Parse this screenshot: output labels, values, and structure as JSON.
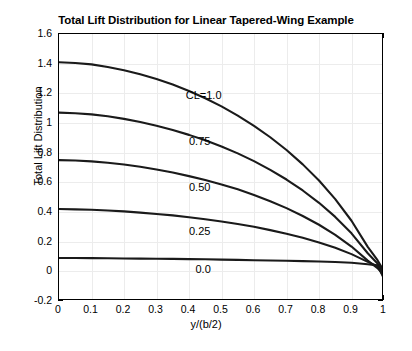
{
  "chart_data": {
    "type": "line",
    "title": "Total Lift Distribution for Linear Tapered-Wing Example",
    "xlabel": "y/(b/2)",
    "ylabel": "Total Lift Distribution",
    "xlim": [
      0,
      1
    ],
    "ylim": [
      -0.2,
      1.6
    ],
    "xticks": [
      "0",
      "0.1",
      "0.2",
      "0.3",
      "0.4",
      "0.5",
      "0.6",
      "0.7",
      "0.8",
      "0.9",
      "1"
    ],
    "yticks": [
      "1.6",
      "1.4",
      "1.2",
      "1",
      "0.8",
      "0.6",
      "0.4",
      "0.2",
      "0",
      "-0.2"
    ],
    "grid": true,
    "legend": "inline-annotations",
    "x": [
      0,
      0.05,
      0.1,
      0.15,
      0.2,
      0.25,
      0.3,
      0.35,
      0.4,
      0.45,
      0.5,
      0.55,
      0.6,
      0.65,
      0.7,
      0.75,
      0.8,
      0.85,
      0.9,
      0.95,
      0.98,
      1
    ],
    "series": [
      {
        "name": "CL=1.0",
        "label": "CL=1.0",
        "values": [
          1.41,
          1.405,
          1.395,
          1.378,
          1.356,
          1.329,
          1.297,
          1.259,
          1.216,
          1.167,
          1.112,
          1.05,
          0.981,
          0.904,
          0.818,
          0.721,
          0.612,
          0.487,
          0.341,
          0.165,
          0.075,
          0.0
        ]
      },
      {
        "name": "CL=0.75",
        "label": "0.75",
        "values": [
          1.07,
          1.066,
          1.058,
          1.045,
          1.028,
          1.007,
          0.982,
          0.953,
          0.92,
          0.883,
          0.842,
          0.795,
          0.743,
          0.684,
          0.619,
          0.545,
          0.462,
          0.367,
          0.256,
          0.122,
          0.053,
          -0.013
        ]
      },
      {
        "name": "CL=0.50",
        "label": "0.50",
        "values": [
          0.75,
          0.747,
          0.741,
          0.732,
          0.72,
          0.705,
          0.687,
          0.666,
          0.642,
          0.616,
          0.586,
          0.553,
          0.515,
          0.473,
          0.426,
          0.373,
          0.314,
          0.246,
          0.167,
          0.072,
          0.022,
          -0.026
        ]
      },
      {
        "name": "CL=0.25",
        "label": "0.25",
        "values": [
          0.42,
          0.418,
          0.415,
          0.41,
          0.404,
          0.396,
          0.387,
          0.377,
          0.365,
          0.351,
          0.336,
          0.319,
          0.3,
          0.278,
          0.254,
          0.226,
          0.195,
          0.159,
          0.116,
          0.064,
          0.035,
          -0.038
        ]
      },
      {
        "name": "CL=0.0",
        "label": "0.0",
        "values": [
          0.09,
          0.09,
          0.089,
          0.088,
          0.087,
          0.086,
          0.085,
          0.084,
          0.082,
          0.081,
          0.079,
          0.077,
          0.075,
          0.073,
          0.071,
          0.069,
          0.066,
          0.063,
          0.058,
          0.048,
          0.04,
          -0.05
        ]
      }
    ],
    "annotations": [
      {
        "text": "CL=1.0",
        "x": 0.39,
        "y": 1.185
      },
      {
        "text": "0.75",
        "x": 0.4,
        "y": 0.875
      },
      {
        "text": "0.50",
        "x": 0.4,
        "y": 0.565
      },
      {
        "text": "0.25",
        "x": 0.4,
        "y": 0.265
      },
      {
        "text": "0.0",
        "x": 0.42,
        "y": 0.01
      }
    ],
    "colors": {
      "line": "#1a1a1a",
      "grid": "#ececec",
      "axis": "#000000",
      "background": "#ffffff"
    }
  }
}
